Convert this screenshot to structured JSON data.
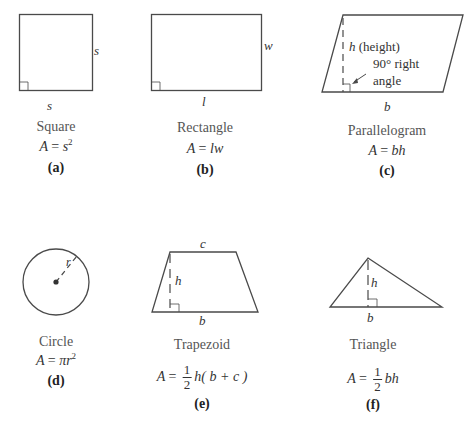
{
  "figures": [
    {
      "id": "a",
      "name": "Square",
      "formula": {
        "lhs": "A",
        "eq": "=",
        "rhs": "s",
        "sup": "2"
      },
      "label": "(a)",
      "dimensions": {
        "side_right": "s",
        "side_bottom": "s"
      }
    },
    {
      "id": "b",
      "name": "Rectangle",
      "formula": {
        "lhs": "A",
        "eq": "=",
        "rhs": "lw"
      },
      "label": "(b)",
      "dimensions": {
        "width": "w",
        "length": "l"
      }
    },
    {
      "id": "c",
      "name": "Parallelogram",
      "formula": {
        "lhs": "A",
        "eq": "=",
        "rhs": "bh"
      },
      "label": "(c)",
      "dimensions": {
        "base": "b",
        "height": "h",
        "height_note": "(height)",
        "angle_note_1": "90° right",
        "angle_note_2": "angle"
      }
    },
    {
      "id": "d",
      "name": "Circle",
      "formula": {
        "lhs": "A",
        "eq": "=",
        "rhs": "πr",
        "sup": "2"
      },
      "label": "(d)",
      "dimensions": {
        "radius": "r"
      }
    },
    {
      "id": "e",
      "name": "Trapezoid",
      "formula": {
        "lhs": "A",
        "eq": "=",
        "num": "1",
        "den": "2",
        "rhs": "h( b + c )"
      },
      "label": "(e)",
      "dimensions": {
        "top": "c",
        "height": "h",
        "base": "b"
      }
    },
    {
      "id": "f",
      "name": "Triangle",
      "formula": {
        "lhs": "A",
        "eq": "=",
        "num": "1",
        "den": "2",
        "rhs": "bh"
      },
      "label": "(f)",
      "dimensions": {
        "height": "h",
        "base": "b"
      }
    }
  ],
  "colors": {
    "stroke": "#4a4a4a",
    "text": "#333333"
  }
}
